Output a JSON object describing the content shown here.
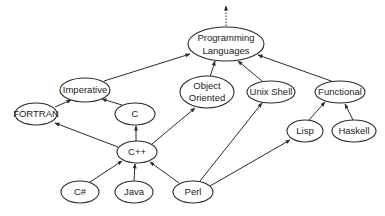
{
  "diagram": {
    "nodes": [
      {
        "id": "pl",
        "label_lines": [
          "Programming",
          "Languages"
        ]
      },
      {
        "id": "imperative",
        "label_lines": [
          "Imperative"
        ]
      },
      {
        "id": "oo",
        "label_lines": [
          "Object",
          "Oriented"
        ]
      },
      {
        "id": "unix",
        "label_lines": [
          "Unix Shell"
        ]
      },
      {
        "id": "functional",
        "label_lines": [
          "Functional"
        ]
      },
      {
        "id": "fortran",
        "label_lines": [
          "FORTRAN"
        ]
      },
      {
        "id": "c",
        "label_lines": [
          "C"
        ]
      },
      {
        "id": "cpp",
        "label_lines": [
          "C++"
        ]
      },
      {
        "id": "lisp",
        "label_lines": [
          "Lisp"
        ]
      },
      {
        "id": "haskell",
        "label_lines": [
          "Haskell"
        ]
      },
      {
        "id": "csharp",
        "label_lines": [
          "C#"
        ]
      },
      {
        "id": "java",
        "label_lines": [
          "Java"
        ]
      },
      {
        "id": "perl",
        "label_lines": [
          "Perl"
        ]
      }
    ],
    "edges": [
      {
        "from": "imperative",
        "to": "pl"
      },
      {
        "from": "oo",
        "to": "pl"
      },
      {
        "from": "unix",
        "to": "pl"
      },
      {
        "from": "functional",
        "to": "pl"
      },
      {
        "from": "fortran",
        "to": "imperative"
      },
      {
        "from": "c",
        "to": "imperative"
      },
      {
        "from": "cpp",
        "to": "c"
      },
      {
        "from": "cpp",
        "to": "fortran"
      },
      {
        "from": "cpp",
        "to": "oo"
      },
      {
        "from": "csharp",
        "to": "cpp"
      },
      {
        "from": "java",
        "to": "cpp"
      },
      {
        "from": "perl",
        "to": "cpp"
      },
      {
        "from": "perl",
        "to": "unix"
      },
      {
        "from": "perl",
        "to": "lisp"
      },
      {
        "from": "lisp",
        "to": "functional"
      },
      {
        "from": "haskell",
        "to": "functional"
      }
    ],
    "root_continuation": "dotted arrow upward from Programming Languages"
  }
}
